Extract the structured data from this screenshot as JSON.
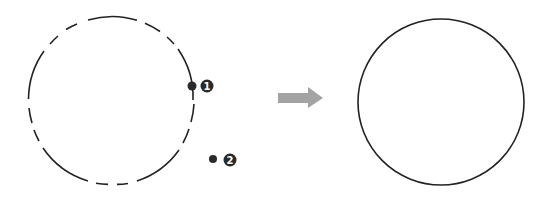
{
  "diagram": {
    "type": "before-after transformation",
    "colors": {
      "stroke": "#222222",
      "marker": "#2a2a2a",
      "arrow": "#a0a0a0",
      "background": "#ffffff"
    },
    "left_figure": {
      "shape": "circle",
      "style": "dashed (partial, with gaps)",
      "markers": [
        {
          "label": "1",
          "position": "on circle, right side"
        },
        {
          "label": "2",
          "position": "outside circle, lower right"
        }
      ]
    },
    "arrow": {
      "direction": "right"
    },
    "right_figure": {
      "shape": "circle",
      "style": "solid"
    }
  }
}
